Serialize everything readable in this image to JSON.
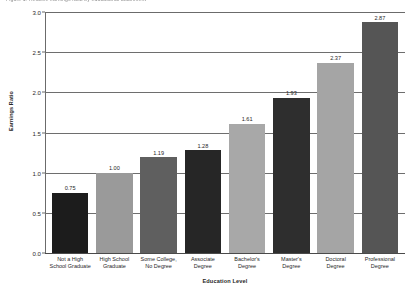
{
  "figure": {
    "caption": "Figure 1. Relative earnings ratio by educational attainment"
  },
  "chart_data": {
    "type": "bar",
    "title": "",
    "xlabel": "Education Level",
    "ylabel": "Earnings Ratio",
    "categories": [
      "Not a High School Graduate",
      "High School Graduate",
      "Some College, No Degree",
      "Associate Degree",
      "Bachelor's Degree",
      "Master's Degree",
      "Doctoral Degree",
      "Professional Degree"
    ],
    "category_lines": [
      [
        "Not a High",
        "School Graduate"
      ],
      [
        "High School",
        "Graduate"
      ],
      [
        "Some College,",
        "No Degree"
      ],
      [
        "Associate",
        "Degree"
      ],
      [
        "Bachelor's",
        "Degree"
      ],
      [
        "Master's",
        "Degree"
      ],
      [
        "Doctoral",
        "Degree"
      ],
      [
        "Professional",
        "Degree"
      ]
    ],
    "values": [
      0.75,
      1.0,
      1.19,
      1.28,
      1.61,
      1.93,
      2.37,
      2.87
    ],
    "value_labels": [
      "0.75",
      "1.00",
      "1.19",
      "1.28",
      "1.61",
      "1.93",
      "2.37",
      "2.87"
    ],
    "bar_colors": [
      "#1c1c1c",
      "#9a9a9a",
      "#5f5f5f",
      "#262626",
      "#a8a8a8",
      "#2e2e2e",
      "#a5a5a5",
      "#555555"
    ],
    "ylim": [
      0.0,
      3.0
    ],
    "yticks": [
      0.0,
      0.5,
      1.0,
      1.5,
      2.0,
      2.5,
      3.0
    ],
    "ytick_labels": [
      "0.0",
      "0.5",
      "1.0",
      "1.5",
      "2.0",
      "2.5",
      "3.0"
    ],
    "grid": true,
    "grid_axis": "y",
    "legend": false
  }
}
